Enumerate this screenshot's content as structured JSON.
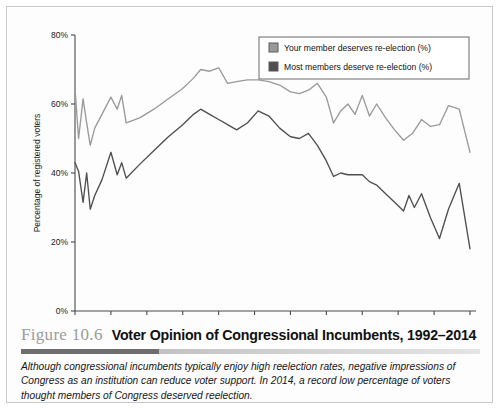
{
  "figure": {
    "number": "Figure 10.6",
    "title": "Voter Opinion of Congressional Incumbents, 1992–2014",
    "caption": "Although congressional incumbents typically enjoy high reelection rates, negative impressions of Congress as an institution can reduce voter support. In 2014, a record low percentage of voters thought members of Congress deserved reelection."
  },
  "colors": {
    "series_light": "#9a9a9a",
    "series_dark": "#4f4f4f",
    "axis": "#4a4a4a",
    "frame": "#c9c9c9",
    "figure_number": "#9b9b9b"
  },
  "chart_data": {
    "type": "line",
    "title": "Voter Opinion of Congressional Incumbents, 1992–2014",
    "xlabel": "",
    "ylabel": "Percentage of registered voters",
    "xlim": [
      1992,
      2014
    ],
    "ylim": [
      0,
      80
    ],
    "ytick_labels": [
      "0%",
      "20%",
      "40%",
      "60%",
      "80%"
    ],
    "ytick_values": [
      0,
      20,
      40,
      60,
      80
    ],
    "xtick_labels": [
      "1992",
      "1994",
      "1996",
      "1998",
      "2000",
      "2002",
      "2004",
      "2006",
      "2008",
      "2010",
      "2012",
      "2014"
    ],
    "xtick_values": [
      1992,
      1994,
      1996,
      1998,
      2000,
      2002,
      2004,
      2006,
      2008,
      2010,
      2012,
      2014
    ],
    "grid": false,
    "legend_position": "top-right",
    "series": [
      {
        "name": "Your member deserves re-election (%)",
        "color": "#9a9a9a",
        "x": [
          1992.0,
          1992.2,
          1992.45,
          1992.65,
          1992.85,
          1993.1,
          1993.5,
          1994.0,
          1994.35,
          1994.6,
          1994.85,
          1995.6,
          1996.4,
          1997.2,
          1998.0,
          1998.6,
          1999.0,
          1999.5,
          2000.0,
          2000.5,
          2001.0,
          2001.6,
          2002.2,
          2002.8,
          2003.4,
          2004.0,
          2004.5,
          2005.0,
          2005.5,
          2006.0,
          2006.4,
          2006.8,
          2007.2,
          2007.6,
          2008.0,
          2008.4,
          2008.8,
          2009.3,
          2009.8,
          2010.3,
          2010.8,
          2011.3,
          2011.8,
          2012.3,
          2012.8,
          2013.4,
          2014.0
        ],
        "y": [
          64.5,
          50.0,
          61.5,
          54.5,
          48.0,
          53.0,
          57.0,
          62.0,
          58.5,
          62.5,
          54.5,
          56.0,
          58.5,
          61.5,
          64.5,
          67.5,
          70.0,
          69.5,
          70.5,
          66.0,
          66.5,
          67.0,
          67.0,
          66.5,
          65.5,
          63.5,
          63.0,
          64.0,
          66.0,
          62.0,
          54.5,
          58.0,
          60.0,
          57.0,
          62.5,
          56.5,
          60.0,
          56.0,
          52.5,
          49.5,
          51.5,
          55.5,
          53.5,
          54.0,
          59.5,
          58.5,
          46.0
        ]
      },
      {
        "name": "Most members deserve re-election (%)",
        "color": "#4f4f4f",
        "x": [
          1992.0,
          1992.2,
          1992.45,
          1992.65,
          1992.85,
          1993.1,
          1993.5,
          1994.0,
          1994.35,
          1994.6,
          1994.85,
          1995.6,
          1996.4,
          1997.2,
          1998.0,
          1998.6,
          1999.0,
          1999.5,
          2000.0,
          2000.5,
          2001.0,
          2001.6,
          2002.2,
          2002.8,
          2003.4,
          2004.0,
          2004.5,
          2005.0,
          2005.5,
          2006.0,
          2006.4,
          2006.8,
          2007.2,
          2007.6,
          2008.0,
          2008.4,
          2008.8,
          2009.3,
          2009.8,
          2010.3,
          2010.6,
          2010.9,
          2011.3,
          2011.8,
          2012.3,
          2012.8,
          2013.4,
          2014.0
        ],
        "y": [
          43.0,
          40.5,
          31.5,
          40.0,
          29.5,
          33.5,
          38.0,
          46.0,
          39.5,
          43.0,
          38.5,
          42.5,
          46.5,
          50.5,
          54.0,
          57.0,
          58.5,
          57.0,
          55.5,
          54.0,
          52.5,
          54.5,
          58.0,
          56.5,
          53.0,
          50.5,
          50.0,
          51.5,
          48.0,
          43.5,
          39.0,
          40.0,
          39.5,
          39.5,
          39.5,
          37.5,
          36.5,
          34.0,
          31.5,
          29.0,
          33.5,
          30.0,
          34.0,
          27.0,
          21.0,
          29.5,
          37.0,
          18.0
        ]
      }
    ]
  }
}
